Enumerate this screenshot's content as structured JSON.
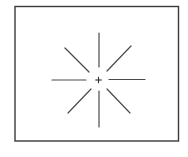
{
  "diagram": {
    "type": "radial-line-stimulus",
    "background": "#ffffff",
    "frame": {
      "x": 15,
      "y": 6.5,
      "width": 163.5,
      "height": 134.5,
      "stroke": "#3a3a3a",
      "stroke_width": 1.4
    },
    "fixation_cross": {
      "cx": 98.5,
      "cy": 80,
      "arm": 3.2,
      "stroke": "#2f2f2f",
      "stroke_width": 1.1
    },
    "line_style": {
      "stroke": "#4a4a4a",
      "stroke_width": 1.2
    },
    "radial_lines": [
      {
        "name": "top",
        "x1": 99,
        "y1": 33,
        "x2": 99,
        "y2": 67
      },
      {
        "name": "bottom",
        "x1": 99,
        "y1": 91,
        "x2": 99,
        "y2": 127
      },
      {
        "name": "left",
        "x1": 52,
        "y1": 80,
        "x2": 86,
        "y2": 80
      },
      {
        "name": "right",
        "x1": 109,
        "y1": 79.5,
        "x2": 145,
        "y2": 79.5
      },
      {
        "name": "upper-left",
        "x1": 65,
        "y1": 48,
        "x2": 89,
        "y2": 72
      },
      {
        "name": "upper-right",
        "x1": 107,
        "y1": 71,
        "x2": 131,
        "y2": 46
      },
      {
        "name": "lower-left",
        "x1": 68,
        "y1": 113,
        "x2": 91,
        "y2": 89
      },
      {
        "name": "lower-right",
        "x1": 107,
        "y1": 89,
        "x2": 130,
        "y2": 113
      }
    ]
  }
}
